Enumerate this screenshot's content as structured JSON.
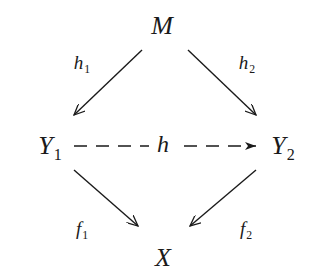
{
  "diagram": {
    "type": "commutative-diagram",
    "text_color": "#1a1a1a",
    "background": "#ffffff",
    "nodes": {
      "M": {
        "label": "M",
        "sub": ""
      },
      "Y1": {
        "label": "Y",
        "sub": "1"
      },
      "Y2": {
        "label": "Y",
        "sub": "2"
      },
      "X": {
        "label": "X",
        "sub": ""
      }
    },
    "edges": [
      {
        "from": "M",
        "to": "Y1",
        "label": "h",
        "sub": "1",
        "style": "solid"
      },
      {
        "from": "M",
        "to": "Y2",
        "label": "h",
        "sub": "2",
        "style": "solid"
      },
      {
        "from": "Y1",
        "to": "Y2",
        "label": "h",
        "sub": "",
        "style": "dashed"
      },
      {
        "from": "Y1",
        "to": "X",
        "label": "f",
        "sub": "1",
        "style": "solid"
      },
      {
        "from": "Y2",
        "to": "X",
        "label": "f",
        "sub": "2",
        "style": "solid"
      }
    ]
  }
}
